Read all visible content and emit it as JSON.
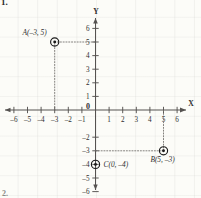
{
  "problem": {
    "number": "1.",
    "next_number": "2."
  },
  "chart_data": {
    "type": "scatter",
    "title": "",
    "xlabel": "X",
    "ylabel": "Y",
    "xlim": [
      -7,
      7
    ],
    "ylim": [
      -7,
      7
    ],
    "grid": true,
    "legend": "none",
    "origin_label": "0",
    "x_ticks": [
      -6,
      -5,
      -4,
      -3,
      -2,
      -1,
      1,
      2,
      3,
      4,
      5,
      6
    ],
    "x_tick_labels": [
      "–6",
      "–5",
      "–4",
      "–3",
      "–2",
      "–1",
      "1",
      "2",
      "3",
      "4",
      "5",
      "6"
    ],
    "y_ticks": [
      6,
      5,
      4,
      3,
      2,
      1,
      -2,
      -3,
      -4,
      -5,
      -6
    ],
    "y_tick_labels": [
      "6",
      "5",
      "4",
      "3",
      "2",
      "1",
      "–2",
      "–3",
      "–4",
      "–5",
      "–6"
    ],
    "points": [
      {
        "name": "A",
        "x": -3,
        "y": 5,
        "label": "A(–3, 5)"
      },
      {
        "name": "B",
        "x": 5,
        "y": -3,
        "label": "B(5, –3)"
      },
      {
        "name": "C",
        "x": 0,
        "y": -4,
        "label": "C(0, –4)"
      }
    ],
    "guide_lines": [
      {
        "point": "A",
        "orientation": "horizontal",
        "from": [
          -3,
          5
        ],
        "to": [
          0,
          5
        ]
      },
      {
        "point": "A",
        "orientation": "vertical",
        "from": [
          -3,
          5
        ],
        "to": [
          -3,
          0
        ]
      },
      {
        "point": "B",
        "orientation": "horizontal",
        "from": [
          0,
          -3
        ],
        "to": [
          5,
          -3
        ]
      },
      {
        "point": "B",
        "orientation": "vertical",
        "from": [
          5,
          -3
        ],
        "to": [
          5,
          0
        ]
      }
    ]
  },
  "colors": {
    "axis": "#555250",
    "tick_text": "#2f2f2f",
    "guide": "#6e6b68",
    "marker": "#1a1a1a",
    "grid": "#9a968c",
    "background": "#fdfdfb"
  }
}
